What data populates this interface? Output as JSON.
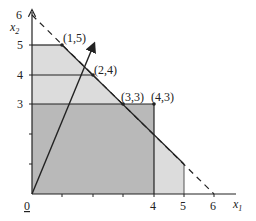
{
  "diagram": {
    "type": "linear-programming-feasible-region",
    "axes": {
      "x_label": "x",
      "x_sub": "1",
      "y_label": "x",
      "y_sub": "2",
      "origin_label": "0",
      "x_ticks": [
        "4",
        "5",
        "6"
      ],
      "y_ticks": [
        "3",
        "4",
        "5",
        "6"
      ]
    },
    "points": [
      {
        "label": "(1,5)",
        "x": 1,
        "y": 5
      },
      {
        "label": "(2,4)",
        "x": 2,
        "y": 4
      },
      {
        "label": "(3,3)",
        "x": 3,
        "y": 3
      },
      {
        "label": "(4,3)",
        "x": 4,
        "y": 3
      }
    ],
    "dashed_line": {
      "description": "x1 + x2 = 6",
      "from": [
        0,
        6
      ],
      "to": [
        6,
        0
      ]
    },
    "arrow": {
      "description": "objective direction",
      "from": [
        0,
        0
      ],
      "to": [
        2,
        5
      ]
    },
    "colors": {
      "dark_region": "#b9b9b9",
      "light_region": "#dcdcdc",
      "lines": "#222222"
    }
  }
}
